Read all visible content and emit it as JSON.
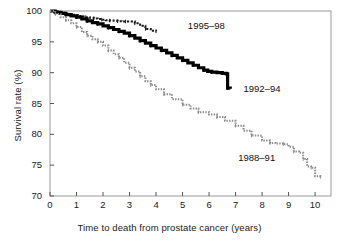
{
  "chart_data": {
    "type": "line",
    "title": "",
    "xlabel": "Time to death from prostate cancer (years)",
    "ylabel": "Survival rate (%)",
    "xlim": [
      0,
      10.6
    ],
    "ylim": [
      70,
      100
    ],
    "xticks": [
      0,
      1,
      2,
      3,
      4,
      5,
      6,
      7,
      8,
      9,
      10
    ],
    "yticks": [
      70,
      75,
      80,
      85,
      90,
      95,
      100
    ],
    "grid": false,
    "legend": "inline-annotations",
    "series": [
      {
        "name": "1995-98",
        "label": "1995–98",
        "color": "#1a1a1a",
        "style": "dotted-step",
        "x": [
          0,
          0.15,
          0.3,
          0.45,
          0.6,
          0.75,
          0.9,
          1.05,
          1.2,
          1.35,
          1.5,
          1.65,
          1.8,
          1.95,
          2.1,
          2.25,
          2.4,
          2.55,
          2.7,
          2.85,
          3.0,
          3.2,
          3.4,
          3.6,
          3.8,
          4.0
        ],
        "y": [
          100,
          99.9,
          99.8,
          99.7,
          99.55,
          99.4,
          99.3,
          99.2,
          99.1,
          99.0,
          98.9,
          98.8,
          98.7,
          98.6,
          98.5,
          98.45,
          98.4,
          98.35,
          98.3,
          98.3,
          98.3,
          98.0,
          97.6,
          97.1,
          96.8,
          96.7
        ]
      },
      {
        "name": "1992-94",
        "label": "1992–94",
        "color": "#000000",
        "style": "thick-step",
        "x": [
          0,
          0.2,
          0.4,
          0.6,
          0.8,
          1.0,
          1.2,
          1.4,
          1.6,
          1.8,
          2.0,
          2.2,
          2.4,
          2.6,
          2.8,
          3.0,
          3.2,
          3.4,
          3.6,
          3.8,
          4.0,
          4.2,
          4.4,
          4.6,
          4.8,
          5.0,
          5.2,
          5.4,
          5.6,
          5.8,
          5.95,
          6.1,
          6.3,
          6.5,
          6.65,
          6.7,
          6.8
        ],
        "y": [
          100,
          99.8,
          99.6,
          99.4,
          99.2,
          99.0,
          98.7,
          98.4,
          98.1,
          97.9,
          97.6,
          97.3,
          97.0,
          96.7,
          96.4,
          96.0,
          95.6,
          95.2,
          94.8,
          94.4,
          94.0,
          93.6,
          93.2,
          92.8,
          92.4,
          92.0,
          91.6,
          91.2,
          90.8,
          90.4,
          90.2,
          90.1,
          90.0,
          89.9,
          89.8,
          87.5,
          87.4
        ]
      },
      {
        "name": "1988-91",
        "label": "1988–91",
        "color": "#8c8c8c",
        "style": "dotted-step",
        "x": [
          0,
          0.2,
          0.4,
          0.6,
          0.8,
          1.0,
          1.2,
          1.4,
          1.6,
          1.8,
          2.0,
          2.2,
          2.4,
          2.6,
          2.8,
          3.0,
          3.2,
          3.4,
          3.6,
          3.8,
          4.0,
          4.3,
          4.6,
          5.0,
          5.3,
          5.6,
          6.0,
          6.3,
          6.6,
          7.0,
          7.3,
          7.6,
          8.0,
          8.3,
          8.5,
          8.8,
          9.0,
          9.2,
          9.4,
          9.55,
          9.7,
          9.85,
          10.0,
          10.2
        ],
        "y": [
          100,
          99.5,
          99.0,
          98.5,
          98.0,
          97.4,
          96.6,
          96.0,
          95.4,
          95.0,
          94.4,
          93.6,
          93.0,
          92.4,
          91.6,
          90.8,
          90.2,
          89.4,
          88.6,
          88.0,
          87.3,
          86.5,
          85.7,
          84.8,
          84.2,
          83.6,
          83.2,
          82.8,
          82.2,
          81.4,
          80.6,
          79.8,
          79.0,
          78.6,
          78.5,
          78.4,
          78.0,
          77.2,
          77.0,
          76.0,
          74.8,
          74.6,
          73.2,
          73.1
        ]
      }
    ],
    "annotations": [
      {
        "text": "1995–98",
        "x": 5.2,
        "y": 97.6
      },
      {
        "text": "1992–94",
        "x": 7.3,
        "y": 87.4
      },
      {
        "text": "1988–91",
        "x": 7.1,
        "y": 76.2
      }
    ]
  },
  "axes": {
    "x_tick_labels": [
      "0",
      "1",
      "2",
      "3",
      "4",
      "5",
      "6",
      "7",
      "8",
      "9",
      "10"
    ],
    "y_tick_labels": [
      "70",
      "75",
      "80",
      "85",
      "90",
      "95",
      "100"
    ],
    "x_title": "Time to death from prostate cancer (years)",
    "y_title": "Survival rate (%)"
  },
  "style": {
    "frame_color": "#9a9a9a",
    "axis_color": "#555555",
    "background": "#ffffff",
    "text_color": "#1a1a1a"
  }
}
